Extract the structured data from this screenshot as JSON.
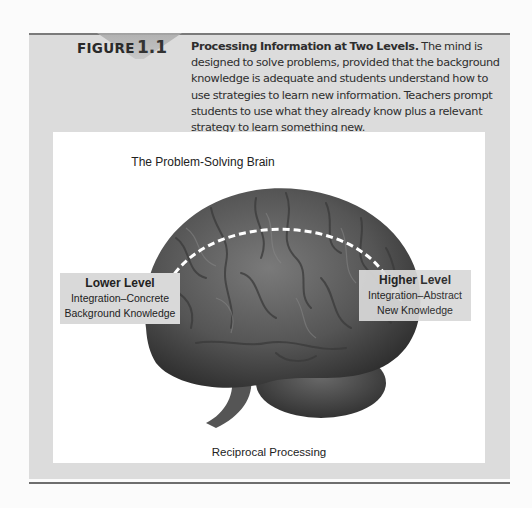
{
  "figure": {
    "label": "FIGURE",
    "number": "1.1",
    "caption_title": "Processing Information at Two Levels.",
    "caption_body": " The mind is designed to solve problems, provided that the background knowledge is adequate and students understand how to use strategies to learn new information. Teachers prompt students to use what they already know plus a relevant strategy to learn something new."
  },
  "diagram": {
    "title": "The Problem-Solving Brain",
    "image": "brain-photo",
    "arrow": "bidirectional-dashed-arc",
    "lower_level": {
      "title": "Lower Level",
      "line1": "Integration–Concrete",
      "line2": "Background Knowledge"
    },
    "higher_level": {
      "title": "Higher Level",
      "line1": "Integration–Abstract",
      "line2": "New Knowledge"
    },
    "footer": "Reciprocal Processing"
  },
  "colors": {
    "panel": "#dcdcdc",
    "rule": "#6e6e6e",
    "label_box": "#d9d9d9"
  }
}
